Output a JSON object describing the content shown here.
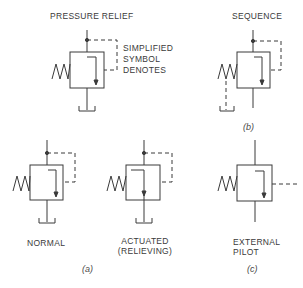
{
  "titles": {
    "pressure_relief": "PRESSURE RELIEF",
    "sequence": "SEQUENCE"
  },
  "notes": {
    "simplified_line1": "SIMPLIFIED",
    "simplified_line2": "SYMBOL",
    "simplified_line3": "DENOTES"
  },
  "labels": {
    "normal": "NORMAL",
    "actuated_line1": "ACTUATED",
    "actuated_line2": "(RELIEVING)",
    "external_line1": "EXTERNAL",
    "external_line2": "PILOT"
  },
  "captions": {
    "a": "(a)",
    "b": "(b)",
    "c": "(c)"
  },
  "colors": {
    "stroke": "#3a3a3a",
    "background": "#ffffff"
  }
}
